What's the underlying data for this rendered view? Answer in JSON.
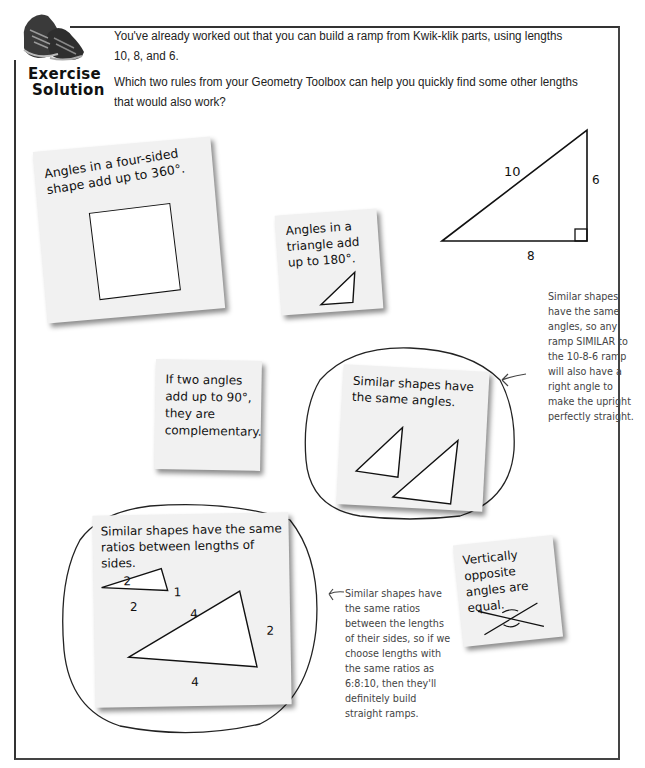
{
  "header": {
    "badge_line1": "Exercise",
    "badge_line2": "Solution",
    "intro_line1": "You've already worked out that you can build a ramp from Kwik-klik parts, using lengths 10, 8, and 6.",
    "intro_line2": "Which two rules from your Geometry Toolbox can help you quickly find some other lengths that would also work?"
  },
  "ramp_diagram": {
    "hypotenuse_label": "10",
    "base_label": "8",
    "upright_label": "6"
  },
  "notes": {
    "four_sided": {
      "text": "Angles in a four-sided shape add up to 360°."
    },
    "triangle": {
      "text": "Angles in a triangle add up to 180°."
    },
    "complementary": {
      "text": "If two angles add up to 90°, they are complementary."
    },
    "similar_angles": {
      "text": "Similar shapes have the same angles.",
      "circled": true
    },
    "similar_ratios": {
      "text": "Similar shapes have the same ratios between lengths of sides.",
      "circled": true,
      "small_triangle": {
        "top_label": "2",
        "base_label": "2",
        "side_label": "1"
      },
      "large_triangle": {
        "top_label": "4",
        "base_label": "4",
        "side_label": "2"
      }
    },
    "vertical_angles": {
      "text": "Vertically opposite angles are equal."
    }
  },
  "annotations": {
    "similar_angles": "Similar shapes have the same angles, so any ramp SIMILAR to the 10-8-6 ramp will also have a right angle to make the upright perfectly straight.",
    "similar_ratios": "Similar shapes have the same ratios between the lengths of their sides, so if we choose lengths with the same ratios as 6:8:10, then they'll definitely build straight ramps."
  }
}
